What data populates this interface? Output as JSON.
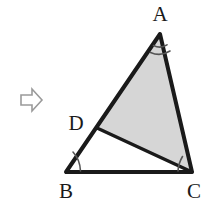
{
  "figure": {
    "type": "geometry-diagram",
    "background_color": "#ffffff",
    "stroke_color": "#1a1a1a",
    "shaded_fill_color": "#d6d6d6",
    "arrow_color": "#9a9a9a",
    "labels": {
      "a": "A",
      "b": "B",
      "c": "C",
      "d": "D"
    },
    "points": {
      "a": {
        "x": 160,
        "y": 34
      },
      "b": {
        "x": 66,
        "y": 172
      },
      "c": {
        "x": 192,
        "y": 172
      },
      "d": {
        "x": 97,
        "y": 128
      }
    },
    "label_positions": {
      "a": {
        "x": 160,
        "y": 21
      },
      "b": {
        "x": 66,
        "y": 198
      },
      "c": {
        "x": 194,
        "y": 198
      },
      "d": {
        "x": 76,
        "y": 130
      }
    },
    "segments": [
      {
        "name": "AB",
        "from": "a",
        "to": "b"
      },
      {
        "name": "BC",
        "from": "b",
        "to": "c"
      },
      {
        "name": "CA",
        "from": "c",
        "to": "a"
      },
      {
        "name": "DC",
        "from": "d",
        "to": "c"
      }
    ],
    "shaded_region": {
      "name": "triangle-ADC",
      "vertices": [
        "a",
        "d",
        "c"
      ]
    },
    "angle_marks": [
      {
        "vertex": "A",
        "arcs": 2,
        "name": "angle-mark-a"
      },
      {
        "vertex": "B",
        "arcs": 1,
        "name": "angle-mark-b"
      },
      {
        "vertex": "C",
        "arcs": 1,
        "name": "angle-mark-c"
      }
    ],
    "arrow": {
      "name": "right-arrow-marker",
      "direction": "right",
      "x": 20,
      "y": 88,
      "width": 22,
      "height": 24
    }
  }
}
